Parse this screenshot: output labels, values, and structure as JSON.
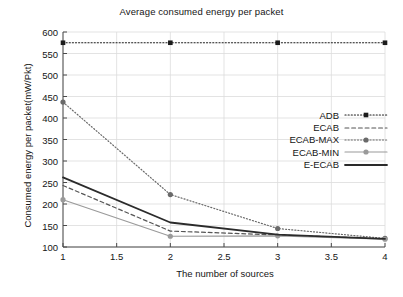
{
  "chart_data": {
    "type": "line",
    "title": "Average consumed energy per packet",
    "xlabel": "The number of sources",
    "ylabel": "Consumed energy per packet(mW/Pkt)",
    "x": [
      1,
      2,
      3,
      4
    ],
    "xlim": [
      1,
      4
    ],
    "ylim": [
      100,
      600
    ],
    "xticks": [
      1,
      1.5,
      2,
      2.5,
      3,
      3.5,
      4
    ],
    "xtick_labels": [
      "1",
      "1.5",
      "2",
      "2.5",
      "3",
      "3.5",
      "4"
    ],
    "yticks": [
      100,
      150,
      200,
      250,
      300,
      350,
      400,
      450,
      500,
      550,
      600
    ],
    "ytick_labels": [
      "100",
      "150",
      "200",
      "250",
      "300",
      "350",
      "400",
      "450",
      "500",
      "550",
      "600"
    ],
    "grid": true,
    "legend_position": "center-right",
    "series": [
      {
        "name": "ADB",
        "values": [
          575,
          575,
          575,
          575
        ],
        "style": "dotted",
        "marker": "square",
        "color": "#1b1b1b",
        "width": 1.2
      },
      {
        "name": "ECAB",
        "values": [
          243,
          137,
          128,
          119
        ],
        "style": "dashed",
        "marker": "none",
        "color": "#555555",
        "width": 1.2
      },
      {
        "name": "ECAB-MAX",
        "values": [
          437,
          222,
          143,
          120
        ],
        "style": "dotted",
        "marker": "circle",
        "color": "#6a6a6a",
        "width": 1.2
      },
      {
        "name": "ECAB-MIN",
        "values": [
          210,
          125,
          126,
          118
        ],
        "style": "solid",
        "marker": "circle",
        "color": "#9a9a9a",
        "width": 1.2
      },
      {
        "name": "E-ECAB",
        "values": [
          262,
          157,
          129,
          119
        ],
        "style": "solid",
        "marker": "none",
        "color": "#2b2b2b",
        "width": 1.8
      }
    ]
  },
  "colors": {
    "grid": "#dcdcdc",
    "axis": "#4a4a4a",
    "text": "#151515",
    "background": "#ffffff"
  }
}
